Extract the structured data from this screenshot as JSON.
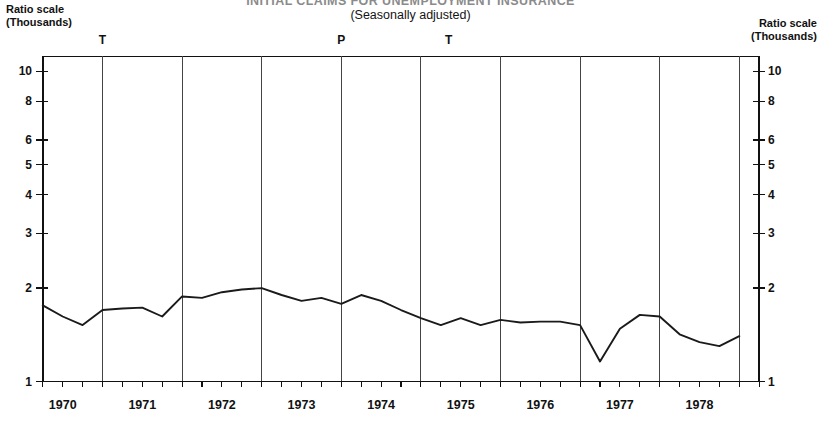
{
  "header": {
    "title_main": "INITIAL CLAIMS FOR UNEMPLOYMENT INSURANCE",
    "title_sub": "(Seasonally adjusted)",
    "left_caption_line1": "Ratio scale",
    "left_caption_line2": "(Thousands)",
    "right_caption_line1": "Ratio scale",
    "right_caption_line2": "(Thousands)"
  },
  "cycle_markers": [
    {
      "label": "T",
      "x_year": 1970.5
    },
    {
      "label": "P",
      "x_year": 1973.5
    },
    {
      "label": "T",
      "x_year": 1974.85
    }
  ],
  "chart_data": {
    "type": "line",
    "title": "INITIAL CLAIMS FOR UNEMPLOYMENT INSURANCE",
    "subtitle": "(Seasonally adjusted)",
    "xlabel": "",
    "ylabel": "Ratio scale (Thousands)",
    "yscale": "log",
    "ylim": [
      1.0,
      11.2
    ],
    "ytick_labels": [
      "1",
      "2",
      "3",
      "4",
      "5",
      "6",
      "8",
      "10"
    ],
    "ytick_values": [
      1,
      2,
      3,
      4,
      5,
      6,
      8,
      10
    ],
    "xlim": [
      1969.75,
      1978.75
    ],
    "xtick_labels": [
      "1970",
      "1971",
      "1972",
      "1973",
      "1974",
      "1975",
      "1976",
      "1977",
      "1978"
    ],
    "xtick_values": [
      1970,
      1971,
      1972,
      1973,
      1974,
      1975,
      1976,
      1977,
      1978
    ],
    "minor_ticks_per_year": 4,
    "grid": "vertical-yearly",
    "legend": "none",
    "shaded_regions": [
      {
        "label": "recession",
        "start": 1969.75,
        "end": 1970.5
      },
      {
        "label": "recession",
        "start": 1973.5,
        "end": 1974.85
      }
    ],
    "series": [
      {
        "name": "Initial claims for unemployment insurance",
        "x": [
          1969.75,
          1970.0,
          1970.25,
          1970.5,
          1970.75,
          1971.0,
          1971.25,
          1971.5,
          1971.75,
          1972.0,
          1972.25,
          1972.5,
          1972.75,
          1973.0,
          1973.25,
          1973.5,
          1973.75,
          1974.0,
          1974.25,
          1974.5,
          1974.75,
          1975.0,
          1975.25,
          1975.5,
          1975.75,
          1976.0,
          1976.25,
          1976.5,
          1976.75,
          1977.0,
          1977.25,
          1977.5,
          1977.75,
          1978.0,
          1978.25,
          1978.5
        ],
        "values": [
          1.76,
          1.62,
          1.52,
          1.7,
          1.72,
          1.73,
          1.62,
          1.88,
          1.86,
          1.94,
          1.98,
          2.0,
          1.9,
          1.82,
          1.86,
          1.78,
          1.9,
          1.82,
          1.7,
          1.6,
          1.52,
          1.6,
          1.52,
          1.58,
          1.55,
          1.56,
          1.56,
          1.52,
          1.16,
          1.48,
          1.64,
          1.62,
          1.42,
          1.34,
          1.3,
          1.4
        ]
      }
    ]
  }
}
